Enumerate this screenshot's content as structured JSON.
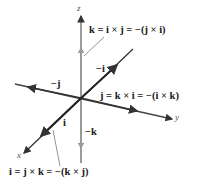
{
  "diagram": {
    "type": "3d-coordinate-axes",
    "axes": {
      "x": "x",
      "y": "y",
      "z": "z"
    },
    "vector_labels": {
      "i": "i",
      "neg_i": "−i",
      "j": "−j",
      "neg_k": "−k"
    },
    "equations": {
      "k": "k = i × j = −(j × i)",
      "j": "j = k × i = −(i × k)",
      "i": "i = j × k = −(k × j)"
    },
    "colors": {
      "axis": "#555555",
      "vector": "#2b2b2b",
      "text": "#1a1a1a"
    }
  }
}
